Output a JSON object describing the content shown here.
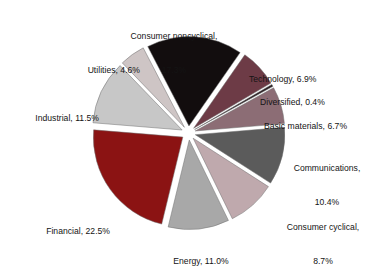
{
  "chart_data": {
    "type": "pie",
    "title": "",
    "subtitle": "",
    "xlabel": "",
    "ylabel": "",
    "legend_position": "none",
    "grid": false,
    "exploded": true,
    "start_angle_deg": -27.4,
    "direction": "clockwise",
    "units": "percent",
    "total": 100.0,
    "categories": [
      "Consumer noncyclical",
      "Technology",
      "Diversified",
      "Basic materials",
      "Communications",
      "Consumer cyclical",
      "Energy",
      "Financial",
      "Industrial",
      "Utilities"
    ],
    "values": [
      17.3,
      6.9,
      0.4,
      6.7,
      10.4,
      8.7,
      11.0,
      22.5,
      11.5,
      4.6
    ],
    "colors": [
      "#120d0e",
      "#6d3b46",
      "#2a1f22",
      "#8c6d75",
      "#5b5b5b",
      "#bfa9ad",
      "#a8a8a8",
      "#8b1313",
      "#c7c7c7",
      "#cec5c5"
    ],
    "slices": [
      {
        "name": "Consumer noncyclical",
        "value": 17.3,
        "label": "Consumer noncyclical,\n17.3%",
        "color": "#120d0e",
        "label_line1": "Consumer noncyclical,",
        "label_line2": "17.3%"
      },
      {
        "name": "Technology",
        "value": 6.9,
        "label": "Technology, 6.9%",
        "color": "#6d3b46",
        "label_line1": "Technology, 6.9%",
        "label_line2": ""
      },
      {
        "name": "Diversified",
        "value": 0.4,
        "label": "Diversified, 0.4%",
        "color": "#2a1f22",
        "label_line1": "Diversified, 0.4%",
        "label_line2": ""
      },
      {
        "name": "Basic materials",
        "value": 6.7,
        "label": "Basic materials, 6.7%",
        "color": "#8c6d75",
        "label_line1": "Basic materials, 6.7%",
        "label_line2": ""
      },
      {
        "name": "Communications",
        "value": 10.4,
        "label": "Communications,\n10.4%",
        "color": "#5b5b5b",
        "label_line1": "Communications,",
        "label_line2": "10.4%"
      },
      {
        "name": "Consumer cyclical",
        "value": 8.7,
        "label": "Consumer cyclical,\n8.7%",
        "color": "#bfa9ad",
        "label_line1": "Consumer cyclical,",
        "label_line2": "8.7%"
      },
      {
        "name": "Energy",
        "value": 11.0,
        "label": "Energy, 11.0%",
        "color": "#a8a8a8",
        "label_line1": "Energy, 11.0%",
        "label_line2": ""
      },
      {
        "name": "Financial",
        "value": 22.5,
        "label": "Financial, 22.5%",
        "color": "#8b1313",
        "label_line1": "Financial, 22.5%",
        "label_line2": ""
      },
      {
        "name": "Industrial",
        "value": 11.5,
        "label": "Industrial, 11.5%",
        "color": "#c7c7c7",
        "label_line1": "Industrial, 11.5%",
        "label_line2": ""
      },
      {
        "name": "Utilities",
        "value": 4.6,
        "label": "Utilities, 4.6%",
        "color": "#cec5c5",
        "label_line1": "Utilities, 4.6%",
        "label_line2": ""
      }
    ]
  },
  "labels": {
    "consumer_noncyclical_l1": "Consumer noncyclical,",
    "consumer_noncyclical_l2": "17.3%",
    "technology": "Technology, 6.9%",
    "diversified": "Diversified, 0.4%",
    "basic_materials": "Basic materials, 6.7%",
    "communications_l1": "Communications,",
    "communications_l2": "10.4%",
    "consumer_cyclical_l1": "Consumer cyclical,",
    "consumer_cyclical_l2": "8.7%",
    "energy": "Energy, 11.0%",
    "financial": "Financial, 22.5%",
    "industrial": "Industrial, 11.5%",
    "utilities": "Utilities, 4.6%"
  }
}
